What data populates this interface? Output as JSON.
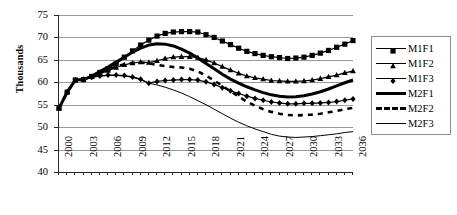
{
  "chart_data": {
    "type": "line",
    "title": "",
    "subtitle": "",
    "xlabel": "",
    "ylabel": "Thousands",
    "ylim": [
      40,
      75
    ],
    "ytick_step": 5,
    "yticks": [
      75,
      70,
      65,
      60,
      55,
      50,
      45,
      40
    ],
    "xlim": [
      2000,
      2036
    ],
    "xtick_step": 3,
    "xticks": [
      "2000",
      "2003",
      "2006",
      "2009",
      "2012",
      "2015",
      "2018",
      "2021",
      "2024",
      "2027",
      "2030",
      "2033",
      "2036"
    ],
    "x": [
      2000,
      2001,
      2002,
      2003,
      2004,
      2005,
      2006,
      2007,
      2008,
      2009,
      2010,
      2011,
      2012,
      2013,
      2014,
      2015,
      2016,
      2017,
      2018,
      2019,
      2020,
      2021,
      2022,
      2023,
      2024,
      2025,
      2026,
      2027,
      2028,
      2029,
      2030,
      2031,
      2032,
      2033,
      2034,
      2035,
      2036
    ],
    "grid": true,
    "grid_axis": "y",
    "legend_position": "right",
    "series": [
      {
        "name": "M1F1",
        "marker": "square",
        "line_style": "solid",
        "line_width": 1.2,
        "color": "#000000",
        "values": [
          54.2,
          57.8,
          60.5,
          60.6,
          61.3,
          62.2,
          63.0,
          64.2,
          65.6,
          67.0,
          68.3,
          69.4,
          70.3,
          70.9,
          71.2,
          71.3,
          71.3,
          71.2,
          70.6,
          70.0,
          69.2,
          68.4,
          67.6,
          66.9,
          66.4,
          66.0,
          65.7,
          65.5,
          65.3,
          65.4,
          65.6,
          66.0,
          66.5,
          67.1,
          67.8,
          68.5,
          69.3
        ]
      },
      {
        "name": "M1F2",
        "marker": "triangle",
        "line_style": "solid",
        "line_width": 1.2,
        "color": "#000000",
        "values": [
          54.2,
          57.8,
          60.5,
          60.6,
          61.2,
          61.9,
          62.6,
          63.3,
          63.9,
          64.3,
          64.5,
          64.4,
          64.8,
          65.3,
          65.6,
          65.7,
          65.7,
          65.5,
          65.0,
          64.3,
          63.5,
          62.7,
          62.0,
          61.4,
          61.0,
          60.7,
          60.4,
          60.3,
          60.2,
          60.2,
          60.3,
          60.5,
          60.8,
          61.2,
          61.6,
          62.1,
          62.5
        ]
      },
      {
        "name": "M1F3",
        "marker": "diamond",
        "line_style": "solid",
        "line_width": 1.2,
        "color": "#000000",
        "values": [
          54.2,
          57.8,
          60.5,
          60.6,
          61.1,
          61.4,
          61.6,
          61.6,
          61.5,
          61.2,
          60.7,
          59.8,
          60.2,
          60.4,
          60.5,
          60.6,
          60.6,
          60.5,
          60.1,
          59.5,
          58.8,
          58.1,
          57.5,
          56.9,
          56.4,
          56.0,
          55.6,
          55.4,
          55.2,
          55.2,
          55.3,
          55.3,
          55.4,
          55.5,
          55.7,
          56.0,
          56.3
        ]
      },
      {
        "name": "M2F1",
        "marker": "none",
        "line_style": "solid",
        "line_width": 3.0,
        "color": "#000000",
        "values": [
          54.2,
          57.8,
          60.5,
          60.6,
          61.4,
          62.4,
          63.4,
          64.5,
          65.6,
          66.7,
          67.6,
          68.3,
          68.6,
          68.5,
          68.1,
          67.4,
          66.5,
          65.4,
          64.2,
          63.0,
          61.8,
          60.7,
          59.8,
          59.0,
          58.3,
          57.7,
          57.2,
          56.9,
          56.7,
          56.8,
          57.0,
          57.4,
          57.9,
          58.5,
          59.2,
          59.9,
          60.5
        ]
      },
      {
        "name": "M2F2",
        "marker": "none",
        "line_style": "dashed",
        "line_width": 2.6,
        "color": "#000000",
        "values": [
          54.2,
          57.8,
          60.5,
          60.6,
          61.3,
          62.1,
          62.8,
          63.5,
          64.0,
          64.3,
          64.4,
          64.2,
          63.9,
          63.6,
          63.4,
          63.3,
          63.0,
          62.4,
          61.5,
          60.4,
          59.2,
          58.0,
          56.8,
          55.7,
          54.8,
          54.0,
          53.4,
          53.0,
          52.7,
          52.6,
          52.7,
          52.8,
          53.0,
          53.3,
          53.6,
          54.0,
          54.3
        ]
      },
      {
        "name": "M2F3",
        "marker": "none",
        "line_style": "solid",
        "line_width": 1.0,
        "color": "#000000",
        "values": [
          54.2,
          57.8,
          60.5,
          60.6,
          61.1,
          61.4,
          61.5,
          61.5,
          61.4,
          61.1,
          60.6,
          59.8,
          59.4,
          58.9,
          58.3,
          57.6,
          56.8,
          55.9,
          55.0,
          54.0,
          53.0,
          52.0,
          51.1,
          50.3,
          49.6,
          49.0,
          48.4,
          48.0,
          47.8,
          47.7,
          47.8,
          47.9,
          48.1,
          48.3,
          48.5,
          48.8,
          49.0
        ]
      }
    ]
  },
  "legend": {
    "entries": [
      {
        "label": "M1F1"
      },
      {
        "label": "M1F2"
      },
      {
        "label": "M1F3"
      },
      {
        "label": "M2F1"
      },
      {
        "label": "M2F2"
      },
      {
        "label": "M2F3"
      }
    ]
  }
}
